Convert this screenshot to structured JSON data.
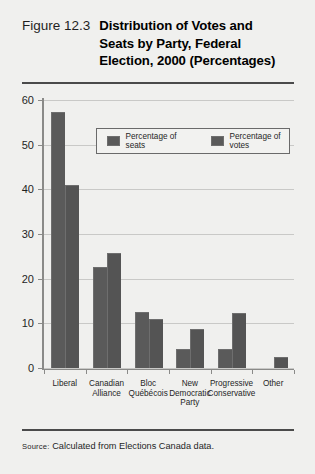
{
  "figure": {
    "label": "Figure 12.3",
    "title_lines": [
      "Distribution of Votes and",
      "Seats by Party, Federal",
      "Election, 2000 (Percentages)"
    ],
    "source_prefix": "Source:",
    "source_text": " Calculated from Elections Canada data."
  },
  "colors": {
    "bar_seats": "#5a5a5a",
    "bar_votes": "#545454",
    "background": "#f0f0ee",
    "rule": "#4a4a4a",
    "axis": "#8a8a88",
    "grid": "#c9c9c7"
  },
  "chart_data": {
    "type": "bar",
    "title": "Distribution of Votes and Seats by Party, Federal Election, 2000 (Percentages)",
    "xlabel": "",
    "ylabel": "",
    "ylim": [
      0,
      60
    ],
    "yticks": [
      0,
      10,
      20,
      30,
      40,
      50,
      60
    ],
    "grid": true,
    "legend_position": "upper-center",
    "categories": [
      "Liberal",
      "Canadian Alliance",
      "Bloc Québécois",
      "New Democratic Party",
      "Progressive Conservative",
      "Other"
    ],
    "category_lines": [
      [
        "Liberal"
      ],
      [
        "Canadian",
        "Alliance"
      ],
      [
        "Bloc",
        "Québécois"
      ],
      [
        "New",
        "Democratic",
        "Party"
      ],
      [
        "Progressive",
        "Conservative"
      ],
      [
        "Other"
      ]
    ],
    "series": [
      {
        "name": "Percentage of seats",
        "values": [
          57.0,
          22.3,
          12.3,
          4.0,
          4.0,
          0.0
        ]
      },
      {
        "name": "Percentage of votes",
        "values": [
          40.8,
          25.5,
          10.7,
          8.5,
          12.2,
          2.3
        ]
      }
    ]
  }
}
